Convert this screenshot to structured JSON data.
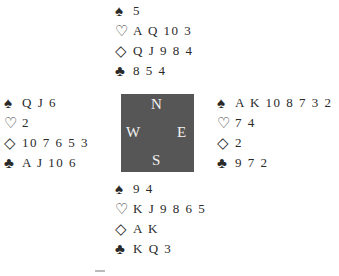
{
  "suits": {
    "spades": "♠",
    "hearts": "♡",
    "diamonds": "◇",
    "clubs": "♣"
  },
  "compass": {
    "north": "N",
    "south": "S",
    "east": "E",
    "west": "W",
    "background": "#565656"
  },
  "hands": {
    "north": {
      "spades": "5",
      "hearts": "A Q 10 3",
      "diamonds": "Q J 9 8 4",
      "clubs": "8 5 4"
    },
    "west": {
      "spades": "Q J 6",
      "hearts": "2",
      "diamonds": "10 7 6 5 3",
      "clubs": "A J 10 6"
    },
    "east": {
      "spades": "A K 10 8 7 3 2",
      "hearts": "7 4",
      "diamonds": "2",
      "clubs": "9 7 2"
    },
    "south": {
      "spades": "9 4",
      "hearts": "K J 9 8 6 5",
      "diamonds": "A K",
      "clubs": "K Q 3"
    }
  }
}
